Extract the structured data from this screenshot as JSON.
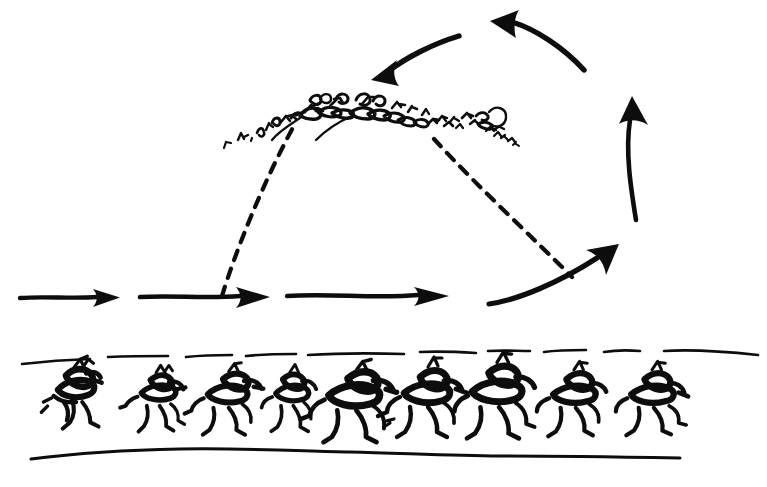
{
  "canvas": {
    "width": 767,
    "height": 487,
    "background_color": "#ffffff",
    "ink_color": "#0d0d0d",
    "style": "hand-drawn pen sketch",
    "title_text": ""
  },
  "figure": {
    "kind": "hand-drawn diagram"
  },
  "elements": {
    "crowd_arc": {
      "name": "scribbled-crowd-arc",
      "label_text": "",
      "x_start": 222,
      "x_end": 520,
      "peak_x": 345,
      "peak_y": 92
    },
    "dashed_trajectory": {
      "name": "dashed-arch",
      "label_text": "",
      "left_leg": {
        "x1": 222,
        "y1": 296,
        "x2": 296,
        "y2": 122
      },
      "right_leg": {
        "x1": 434,
        "y1": 139,
        "x2": 572,
        "y2": 277
      },
      "dash_pattern": "10 9"
    },
    "straight_arrows": [
      {
        "name": "motion-arrow-1",
        "label_text": "",
        "x1": 20,
        "y1": 298,
        "x2": 115,
        "y2": 298,
        "direction": "right"
      },
      {
        "name": "motion-arrow-2",
        "label_text": "",
        "x1": 140,
        "y1": 297,
        "x2": 266,
        "y2": 297,
        "direction": "right"
      },
      {
        "name": "motion-arrow-3",
        "label_text": "",
        "x1": 287,
        "y1": 296,
        "x2": 446,
        "y2": 296,
        "direction": "right"
      }
    ],
    "curved_arrows": [
      {
        "name": "cycle-arrow-up-right",
        "label_text": "",
        "direction": "up-right",
        "from_x": 489,
        "from_y": 303,
        "to_x": 617,
        "to_y": 247
      },
      {
        "name": "cycle-arrow-up",
        "label_text": "",
        "direction": "up",
        "from_x": 636,
        "from_y": 219,
        "to_x": 631,
        "to_y": 99
      },
      {
        "name": "cycle-arrow-up-left",
        "label_text": "",
        "direction": "up-left",
        "from_x": 583,
        "from_y": 69,
        "to_x": 496,
        "to_y": 22
      },
      {
        "name": "cycle-arrow-down-left",
        "label_text": "",
        "direction": "down-left",
        "from_x": 459,
        "from_y": 36,
        "to_x": 374,
        "to_y": 77
      }
    ],
    "ground_band": {
      "name": "ground-band",
      "label_text": "",
      "top_line_y": 357,
      "bottom_line_y": 456,
      "top_line_x_start": 22,
      "top_line_x_end": 758,
      "bottom_line_x_start": 30,
      "bottom_line_x_end": 680
    },
    "runner_figures": [
      {
        "name": "runner-1",
        "label_text": "",
        "x": 72,
        "y": 400,
        "scale": 1.02,
        "flip": false
      },
      {
        "name": "runner-2",
        "label_text": "",
        "x": 156,
        "y": 404,
        "scale": 0.92,
        "flip": false
      },
      {
        "name": "runner-3",
        "label_text": "",
        "x": 223,
        "y": 404,
        "scale": 0.96,
        "flip": false
      },
      {
        "name": "runner-4",
        "label_text": "",
        "x": 288,
        "y": 404,
        "scale": 0.88,
        "flip": false
      },
      {
        "name": "runner-5",
        "label_text": "",
        "x": 350,
        "y": 404,
        "scale": 1.06,
        "flip": false
      },
      {
        "name": "runner-6",
        "label_text": "",
        "x": 424,
        "y": 403,
        "scale": 1.0,
        "flip": false
      },
      {
        "name": "runner-7",
        "label_text": "",
        "x": 495,
        "y": 402,
        "scale": 1.04,
        "flip": false
      },
      {
        "name": "runner-8",
        "label_text": "",
        "x": 572,
        "y": 404,
        "scale": 0.95,
        "flip": false
      },
      {
        "name": "runner-9",
        "label_text": "",
        "x": 652,
        "y": 404,
        "scale": 0.95,
        "flip": false
      }
    ]
  }
}
